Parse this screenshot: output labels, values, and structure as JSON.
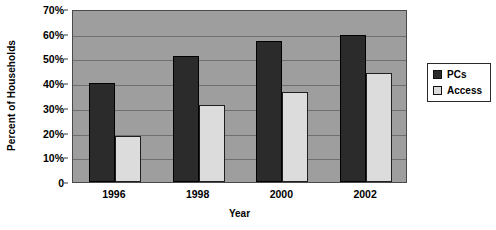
{
  "chart_data": {
    "type": "bar",
    "title": "",
    "xlabel": "Year",
    "ylabel": "Percent of Households",
    "categories": [
      "1996",
      "1998",
      "2000",
      "2002"
    ],
    "series": [
      {
        "name": "PCs",
        "color": "#2b2b2b",
        "values": [
          40,
          51,
          57,
          59.5
        ]
      },
      {
        "name": "Access",
        "color": "#dcdcdc",
        "values": [
          18.5,
          31,
          36.5,
          44
        ]
      }
    ],
    "ylim": [
      0,
      70
    ],
    "ytick_values": [
      0,
      10,
      20,
      30,
      40,
      50,
      60,
      70
    ],
    "ytick_labels": [
      "0",
      "10%",
      "20%",
      "30%",
      "40%",
      "50%",
      "60%",
      "70%"
    ],
    "grid": true,
    "legend_position": "right",
    "plot_background": "#9e9e9e",
    "page_background": "#ffffff"
  },
  "legend": {
    "items": [
      {
        "label": "PCs"
      },
      {
        "label": "Access"
      }
    ]
  }
}
